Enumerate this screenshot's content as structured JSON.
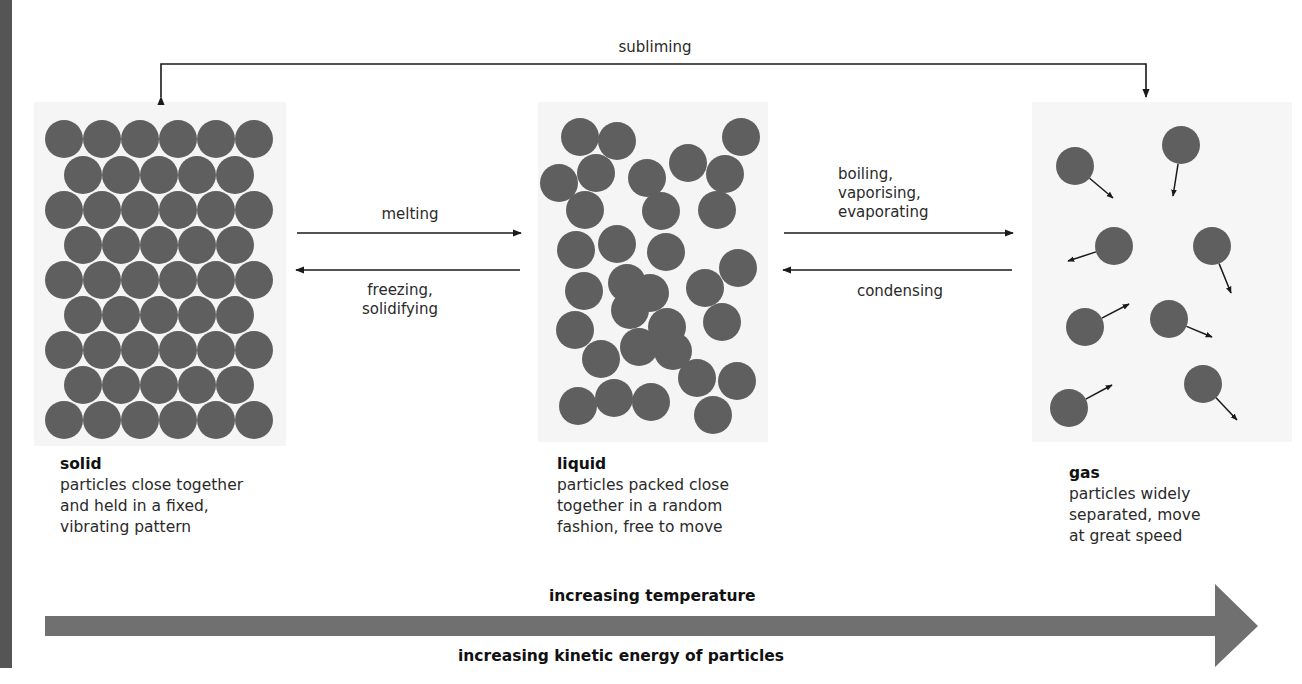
{
  "colors": {
    "particle": "#5f5f5f",
    "arrow_line": "#1a1a1a",
    "big_arrow": "#707070",
    "side_bar": "#555555",
    "box_bg": "#f4f4f4"
  },
  "transitions": {
    "subliming": "subliming",
    "melting": "melting",
    "freezing": "freezing,\nsolidifying",
    "boiling": "boiling,\nvaporising,\nevaporating",
    "condensing": "condensing"
  },
  "states": {
    "solid": {
      "name": "solid",
      "description": "particles close together\nand held in a fixed,\nvibrating pattern"
    },
    "liquid": {
      "name": "liquid",
      "description": "particles packed close\ntogether in a random\nfashion, free to move"
    },
    "gas": {
      "name": "gas",
      "description": "particles widely\nseparated, move\nat great speed"
    }
  },
  "axis": {
    "top_label": "increasing temperature",
    "bottom_label": "increasing kinetic energy of particles"
  },
  "particles": {
    "radius": 19,
    "solid": [
      [
        64,
        139
      ],
      [
        102,
        139
      ],
      [
        140,
        139
      ],
      [
        178,
        139
      ],
      [
        216,
        139
      ],
      [
        254,
        139
      ],
      [
        83,
        175
      ],
      [
        121,
        175
      ],
      [
        159,
        175
      ],
      [
        197,
        175
      ],
      [
        235,
        175
      ],
      [
        64,
        210
      ],
      [
        102,
        210
      ],
      [
        140,
        210
      ],
      [
        178,
        210
      ],
      [
        216,
        210
      ],
      [
        254,
        210
      ],
      [
        83,
        245
      ],
      [
        121,
        245
      ],
      [
        159,
        245
      ],
      [
        197,
        245
      ],
      [
        235,
        245
      ],
      [
        64,
        280
      ],
      [
        102,
        280
      ],
      [
        140,
        280
      ],
      [
        178,
        280
      ],
      [
        216,
        280
      ],
      [
        254,
        280
      ],
      [
        83,
        315
      ],
      [
        121,
        315
      ],
      [
        159,
        315
      ],
      [
        197,
        315
      ],
      [
        235,
        315
      ],
      [
        64,
        350
      ],
      [
        102,
        350
      ],
      [
        140,
        350
      ],
      [
        178,
        350
      ],
      [
        216,
        350
      ],
      [
        254,
        350
      ],
      [
        83,
        385
      ],
      [
        121,
        385
      ],
      [
        159,
        385
      ],
      [
        197,
        385
      ],
      [
        235,
        385
      ],
      [
        64,
        420
      ],
      [
        102,
        420
      ],
      [
        140,
        420
      ],
      [
        178,
        420
      ],
      [
        216,
        420
      ],
      [
        254,
        420
      ]
    ],
    "liquid": [
      [
        580,
        137
      ],
      [
        617,
        141
      ],
      [
        741,
        137
      ],
      [
        596,
        173
      ],
      [
        559,
        183
      ],
      [
        647,
        178
      ],
      [
        688,
        163
      ],
      [
        725,
        174
      ],
      [
        585,
        210
      ],
      [
        661,
        211
      ],
      [
        717,
        210
      ],
      [
        617,
        244
      ],
      [
        576,
        250
      ],
      [
        666,
        252
      ],
      [
        738,
        268
      ],
      [
        627,
        283
      ],
      [
        584,
        291
      ],
      [
        650,
        293
      ],
      [
        705,
        288
      ],
      [
        722,
        322
      ],
      [
        630,
        310
      ],
      [
        667,
        327
      ],
      [
        575,
        330
      ],
      [
        601,
        359
      ],
      [
        639,
        347
      ],
      [
        673,
        351
      ],
      [
        697,
        378
      ],
      [
        737,
        381
      ],
      [
        578,
        406
      ],
      [
        614,
        398
      ],
      [
        651,
        402
      ],
      [
        713,
        415
      ]
    ],
    "gas": [
      {
        "c": [
          1075,
          166
        ],
        "v": [
          1113,
          198
        ]
      },
      {
        "c": [
          1181,
          145
        ],
        "v": [
          1173,
          196
        ]
      },
      {
        "c": [
          1114,
          246
        ],
        "v": [
          1068,
          261
        ]
      },
      {
        "c": [
          1212,
          246
        ],
        "v": [
          1231,
          293
        ]
      },
      {
        "c": [
          1085,
          327
        ],
        "v": [
          1129,
          304
        ]
      },
      {
        "c": [
          1169,
          319
        ],
        "v": [
          1212,
          337
        ]
      },
      {
        "c": [
          1069,
          408
        ],
        "v": [
          1112,
          385
        ]
      },
      {
        "c": [
          1203,
          384
        ],
        "v": [
          1237,
          420
        ]
      }
    ]
  }
}
